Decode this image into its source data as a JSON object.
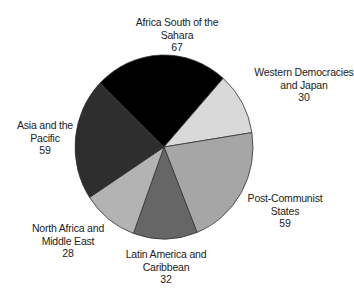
{
  "chart_data": {
    "type": "pie",
    "title": "",
    "total": 275,
    "start_angle_deg": 224,
    "direction": "clockwise",
    "center": [
      164,
      147
    ],
    "radius": [
      89,
      92
    ],
    "slices": [
      {
        "name": "Africa South of the Sahara",
        "label_lines": [
          "Africa South of the",
          "Sahara"
        ],
        "value": 67,
        "color": "#000000",
        "label_pos": [
          177,
          16
        ]
      },
      {
        "name": "Western Democracies and Japan",
        "label_lines": [
          "Western Democracies",
          "and Japan"
        ],
        "value": 30,
        "color": "#d9d9d9",
        "label_pos": [
          304,
          66
        ]
      },
      {
        "name": "Post-Communist States",
        "label_lines": [
          "Post-Communist",
          "States"
        ],
        "value": 59,
        "color": "#a6a6a6",
        "label_pos": [
          285,
          192
        ]
      },
      {
        "name": "Latin America and Caribbean",
        "label_lines": [
          "Latin America and",
          "Caribbean"
        ],
        "value": 32,
        "color": "#666666",
        "label_pos": [
          166,
          248
        ]
      },
      {
        "name": "North Africa and Middle East",
        "label_lines": [
          "North Africa and",
          "Middle East"
        ],
        "value": 28,
        "color": "#b3b3b3",
        "label_pos": [
          68,
          222
        ]
      },
      {
        "name": "Asia and the Pacific",
        "label_lines": [
          "Asia and the",
          "Pacific"
        ],
        "value": 59,
        "color": "#2e2e2e",
        "label_pos": [
          45,
          119
        ]
      }
    ],
    "legend": "none",
    "stroke_color": "#333333"
  }
}
